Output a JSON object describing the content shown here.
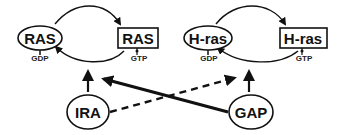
{
  "diagram": {
    "left_cycle": {
      "inactive": {
        "label": "RAS",
        "shape": "ellipse",
        "cofactor": "GDP"
      },
      "active": {
        "label": "RAS",
        "shape": "rectangle",
        "cofactor": "GTP"
      }
    },
    "right_cycle": {
      "inactive": {
        "label": "H-ras",
        "shape": "ellipse",
        "cofactor": "GDP"
      },
      "active": {
        "label": "H-ras",
        "shape": "rectangle",
        "cofactor": "GTP"
      }
    },
    "regulators": [
      {
        "label": "IRA",
        "shape": "ellipse"
      },
      {
        "label": "GAP",
        "shape": "ellipse"
      }
    ],
    "edges": [
      {
        "from": "IRA",
        "to": "left_cycle",
        "style": "solid"
      },
      {
        "from": "GAP",
        "to": "right_cycle",
        "style": "solid"
      },
      {
        "from": "GAP",
        "to": "left_cycle",
        "style": "solid-thick"
      },
      {
        "from": "IRA",
        "to": "right_cycle",
        "style": "dashed"
      }
    ],
    "colors": {
      "stroke": "#111111",
      "background": "#ffffff"
    }
  }
}
